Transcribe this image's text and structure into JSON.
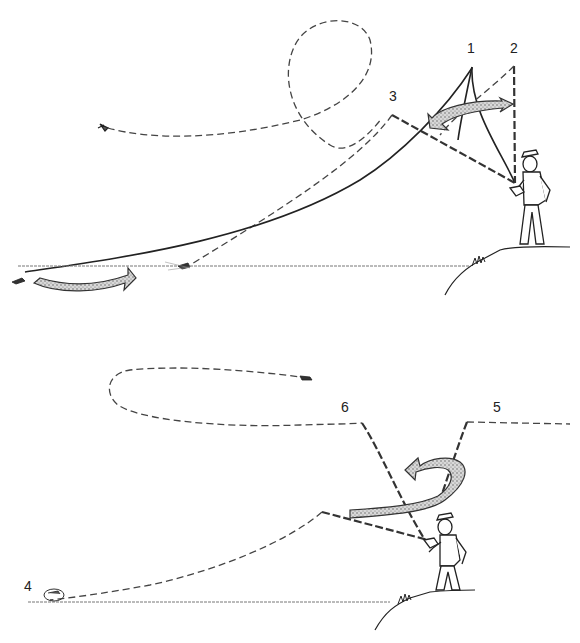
{
  "diagram": {
    "type": "fly-casting-sequence",
    "panels": [
      {
        "name": "back-cast",
        "labels": [
          "1",
          "2",
          "3"
        ]
      },
      {
        "name": "forward-cast",
        "labels": [
          "4",
          "5",
          "6"
        ]
      }
    ]
  },
  "labels": {
    "l1": "1",
    "l2": "2",
    "l3": "3",
    "l4": "4",
    "l5": "5",
    "l6": "6"
  },
  "colors": {
    "line": "#222222",
    "arrow_fill": "#bbbbbb",
    "background": "#ffffff"
  }
}
